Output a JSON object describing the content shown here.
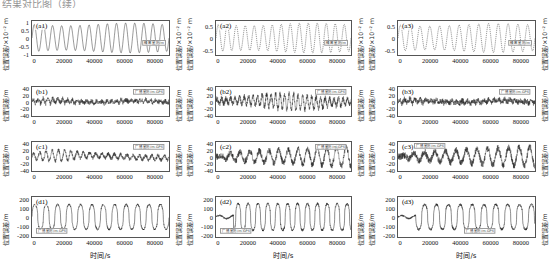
{
  "top_fragment": "结果对比图（续）",
  "axes": {
    "ylabel_small": "位置误差/×10⁻² m",
    "ylabel_m": "位置误差/m",
    "xlabel": "时间/s",
    "xticks": [
      "0",
      "20000",
      "40000",
      "60000",
      "80000"
    ],
    "xlim": [
      -2000,
      90000
    ]
  },
  "chart_data": [
    {
      "type": "line",
      "tag": "(a1)",
      "legend": "精密星历/m",
      "ylabel": "位置误差/×10⁻² m",
      "xlabel": "",
      "yticks": [
        "1",
        "0.5",
        "0",
        "-0.5",
        "-1"
      ],
      "ylim": [
        -1.25,
        1.25
      ],
      "xlim": [
        -2000,
        90000
      ],
      "style": "solid",
      "waveform": "sine",
      "cycles": 15,
      "amplitude": 1.0,
      "noise": 0.02,
      "grid": false
    },
    {
      "type": "line",
      "tag": "(a2)",
      "legend": "精密星历/m",
      "ylabel": "位置误差/×10⁻² m",
      "xlabel": "",
      "yticks": [
        "0.5",
        "0",
        "-0.5"
      ],
      "ylim": [
        -0.85,
        0.85
      ],
      "xlim": [
        -2000,
        90000
      ],
      "style": "dashed",
      "waveform": "sine",
      "cycles": 15,
      "amplitude": 0.68,
      "noise": 0.02,
      "grid": false
    },
    {
      "type": "line",
      "tag": "(a3)",
      "legend": "精密星历/m",
      "ylabel": "位置误差/×10⁻² m",
      "xlabel": "",
      "yticks": [
        "0.5",
        "0",
        "-0.5"
      ],
      "ylim": [
        -0.85,
        0.85
      ],
      "xlim": [
        -2000,
        90000
      ],
      "style": "dashed",
      "waveform": "sine",
      "cycles": 14,
      "amplitude": 0.66,
      "noise": 0.02,
      "grid": false
    },
    {
      "type": "line",
      "tag": "(b1)",
      "legend": "广播星历/m-GPS",
      "ylabel": "位置误差/m",
      "xlabel": "",
      "yticks": [
        "40",
        "20",
        "0",
        "-20",
        "-40"
      ],
      "ylim": [
        -48,
        48
      ],
      "xlim": [
        -2000,
        90000
      ],
      "style": "solid",
      "waveform": "noise-band",
      "cycles": 28,
      "amplitude": 9,
      "noise": 6,
      "grid": false
    },
    {
      "type": "line",
      "tag": "(b2)",
      "legend": "广播星历/m-GPS",
      "ylabel": "位置误差/m",
      "xlabel": "",
      "yticks": [
        "40",
        "20",
        "0",
        "-20",
        "-40"
      ],
      "ylim": [
        -48,
        48
      ],
      "xlim": [
        -2000,
        90000
      ],
      "style": "solid",
      "waveform": "noise-swell",
      "cycles": 30,
      "amplitude": 22,
      "noise": 9,
      "grid": false
    },
    {
      "type": "line",
      "tag": "(b3)",
      "legend": "广播星历/m-GPS",
      "ylabel": "位置误差/m",
      "xlabel": "",
      "yticks": [
        "40",
        "20",
        "0",
        "-20",
        "-40"
      ],
      "ylim": [
        -48,
        48
      ],
      "xlim": [
        -2000,
        90000
      ],
      "style": "solid",
      "waveform": "noise-band",
      "cycles": 26,
      "amplitude": 8,
      "noise": 7,
      "grid": false
    },
    {
      "type": "line",
      "tag": "(c1)",
      "legend": "广播星历/m-GPS",
      "ylabel": "位置误差/m",
      "xlabel": "",
      "yticks": [
        "40",
        "20",
        "0",
        "-20",
        "-40"
      ],
      "ylim": [
        -48,
        48
      ],
      "xlim": [
        -2000,
        90000
      ],
      "style": "solid",
      "waveform": "noise-wave",
      "cycles": 22,
      "amplitude": 14,
      "noise": 6,
      "grid": false
    },
    {
      "type": "line",
      "tag": "(c2)",
      "legend": "广播星历/m-GPS",
      "ylabel": "位置误差/m",
      "xlabel": "",
      "yticks": [
        "40",
        "20",
        "0",
        "-20",
        "-40"
      ],
      "ylim": [
        -52,
        52
      ],
      "xlim": [
        -2000,
        90000
      ],
      "style": "solid",
      "waveform": "noise-ramp",
      "cycles": 14,
      "amplitude": 40,
      "noise": 11,
      "grid": false
    },
    {
      "type": "line",
      "tag": "(c3)",
      "legend": "广播星历/m-GPS",
      "ylabel": "位置误差/m",
      "xlabel": "",
      "yticks": [
        "40",
        "20",
        "0",
        "-20",
        "-40"
      ],
      "ylim": [
        -52,
        52
      ],
      "xlim": [
        -2000,
        90000
      ],
      "style": "solid",
      "waveform": "noise-ramp",
      "cycles": 13,
      "amplitude": 40,
      "noise": 12,
      "grid": false
    },
    {
      "type": "line",
      "tag": "(d1)",
      "legend": "广播星历/m-GPS",
      "ylabel": "位置误差/m",
      "xlabel": "时间/s",
      "yticks": [
        "200",
        "100",
        "0",
        "-100",
        "-200"
      ],
      "ylim": [
        -240,
        240
      ],
      "xlim": [
        -2000,
        90000
      ],
      "style": "solid",
      "waveform": "spiky",
      "cycles": 12,
      "amplitude": 150,
      "noise": 20,
      "grid": false
    },
    {
      "type": "line",
      "tag": "(d2)",
      "legend": "广播星历/m-GPS",
      "ylabel": "位置误差/m",
      "xlabel": "时间/s",
      "yticks": [
        "200",
        "100",
        "0",
        "-100",
        "-200"
      ],
      "ylim": [
        -240,
        240
      ],
      "xlim": [
        -2000,
        90000
      ],
      "style": "solid",
      "waveform": "spiky-gap",
      "cycles": 13,
      "amplitude": 160,
      "noise": 25,
      "grid": false
    },
    {
      "type": "line",
      "tag": "(d3)",
      "legend": "广播星历/m-GPS",
      "ylabel": "位置误差/m",
      "xlabel": "时间/s",
      "yticks": [
        "200",
        "100",
        "0",
        "-100",
        "-200"
      ],
      "ylim": [
        -240,
        240
      ],
      "xlim": [
        -2000,
        90000
      ],
      "style": "solid",
      "waveform": "spiky-gap",
      "cycles": 11,
      "amplitude": 150,
      "noise": 25,
      "grid": false
    }
  ]
}
